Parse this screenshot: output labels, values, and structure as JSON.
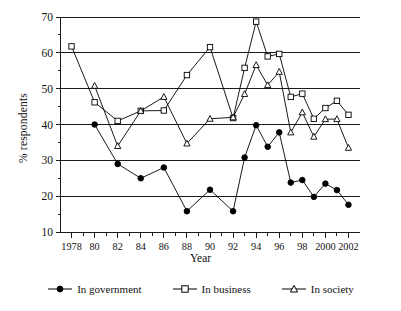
{
  "chart_data": {
    "type": "line",
    "title": "",
    "xlabel": "Year",
    "ylabel": "% respondents",
    "xlim": [
      1977,
      2003
    ],
    "ylim": [
      10,
      70
    ],
    "ytick_values": [
      10,
      20,
      30,
      40,
      50,
      60,
      70
    ],
    "ytick_labels": [
      "10",
      "20",
      "30",
      "40",
      "50",
      "60",
      "70"
    ],
    "xtick_values": [
      1978,
      1979,
      1980,
      1981,
      1982,
      1983,
      1984,
      1985,
      1986,
      1987,
      1988,
      1989,
      1990,
      1991,
      1992,
      1993,
      1994,
      1995,
      1996,
      1997,
      1998,
      1999,
      2000,
      2001,
      2002
    ],
    "xtick_labels": [
      "1978",
      "",
      "80",
      "",
      "82",
      "",
      "84",
      "",
      "86",
      "",
      "88",
      "",
      "90",
      "",
      "92",
      "",
      "94",
      "",
      "96",
      "",
      "98",
      "",
      "2000",
      "",
      "2002"
    ],
    "grid": "horizontal",
    "legend_position": "bottom",
    "series": [
      {
        "name": "In government",
        "marker": "filled-circle",
        "color": "#000000",
        "x": [
          1980,
          1982,
          1984,
          1986,
          1988,
          1990,
          1992,
          1993,
          1994,
          1995,
          1996,
          1997,
          1998,
          1999,
          2000,
          2001,
          2002
        ],
        "values": [
          40.0,
          29.0,
          25.0,
          28.0,
          15.8,
          21.8,
          15.8,
          30.8,
          39.8,
          33.8,
          37.8,
          23.8,
          24.5,
          19.8,
          23.5,
          21.7,
          17.6
        ]
      },
      {
        "name": "In business",
        "marker": "open-square",
        "color": "#000000",
        "x": [
          1978,
          1980,
          1982,
          1984,
          1986,
          1988,
          1990,
          1992,
          1993,
          1994,
          1995,
          1996,
          1997,
          1998,
          1999,
          2000,
          2001,
          2002
        ],
        "values": [
          61.8,
          46.2,
          41.0,
          43.8,
          43.9,
          53.8,
          61.6,
          41.8,
          55.8,
          68.7,
          59.0,
          59.7,
          47.7,
          48.6,
          41.6,
          44.6,
          46.6,
          42.7
        ]
      },
      {
        "name": "In society",
        "marker": "open-triangle",
        "color": "#000000",
        "x": [
          1980,
          1982,
          1984,
          1986,
          1988,
          1990,
          1992,
          1993,
          1994,
          1995,
          1996,
          1997,
          1998,
          1999,
          2000,
          2001,
          2002
        ],
        "values": [
          50.8,
          34.0,
          43.8,
          47.7,
          34.7,
          41.6,
          42.0,
          48.5,
          56.6,
          51.0,
          54.7,
          37.8,
          43.4,
          36.6,
          41.5,
          41.5,
          33.5
        ]
      }
    ]
  },
  "legend": {
    "items": [
      {
        "label": "In government"
      },
      {
        "label": "In business"
      },
      {
        "label": "In society"
      }
    ]
  },
  "axes": {
    "x_title": "Year",
    "y_title": "% respondents"
  }
}
